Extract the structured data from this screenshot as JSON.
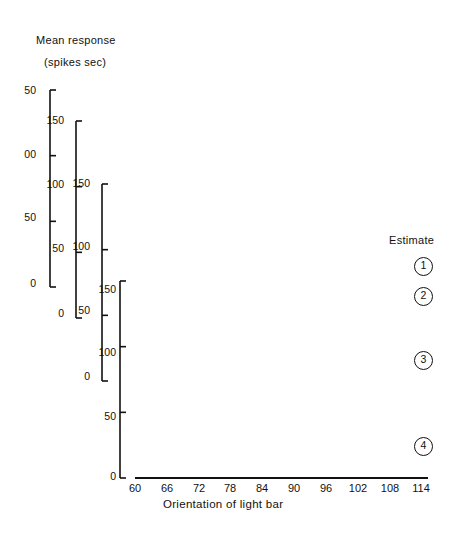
{
  "figure": {
    "y_axis_title_line1": "Mean response",
    "y_axis_title_line2": "(spikes sec)",
    "x_axis_title": "Orientation of light bar",
    "estimate_label": "Estimate",
    "background_color": "#ffffff",
    "ink_color": "#111111"
  },
  "axes": {
    "y_tick_labels": [
      "150",
      "100",
      "50",
      "0"
    ],
    "y_tick_values": [
      150,
      100,
      50,
      0
    ],
    "y_units": "spikes/sec",
    "axis1_top_label_clipped": "50",
    "axis1_mid_label_clipped": "00",
    "x_tick_labels": [
      "60",
      "66",
      "72",
      "78",
      "84",
      "90",
      "96",
      "102",
      "108",
      "114"
    ],
    "x_tick_values": [
      60,
      66,
      72,
      78,
      84,
      90,
      96,
      102,
      108,
      114
    ],
    "x_units": "degrees",
    "x_degree_marks": "°"
  },
  "annotations": {
    "peak_line_orientation": 84,
    "peak_line_style": "dashed",
    "peak_arrow_direction": "up",
    "arrow_count": 4
  },
  "curves": [
    {
      "id": 1,
      "label": "1",
      "marker": "open-circle"
    },
    {
      "id": 2,
      "label": "2",
      "marker": "filled-circle"
    },
    {
      "id": 3,
      "label": "3",
      "marker": "open-circle"
    },
    {
      "id": 4,
      "label": "4",
      "marker": "filled-circle"
    }
  ],
  "chart_data": {
    "type": "line",
    "xlabel": "Orientation of light bar",
    "ylabel": "Mean response (spikes sec)",
    "xlim": [
      60,
      114
    ],
    "ylim": [
      0,
      150
    ],
    "grid": false,
    "legend": "Estimate 1-4, right side, circled numbers",
    "x": [
      60,
      63,
      66,
      69,
      72,
      75,
      78,
      81,
      84,
      87,
      90,
      93,
      96,
      99,
      102,
      105,
      108,
      111,
      114
    ],
    "series": [
      {
        "name": "Estimate 1",
        "marker": "open-circle",
        "values": [
          41,
          37,
          46,
          62,
          82,
          103,
          124,
          139,
          147,
          149,
          141,
          126,
          110,
          96,
          83,
          72,
          62,
          55,
          50
        ]
      },
      {
        "name": "Estimate 2",
        "marker": "filled-circle",
        "values": [
          30,
          27,
          36,
          54,
          76,
          100,
          122,
          137,
          145,
          143,
          132,
          118,
          101,
          85,
          71,
          60,
          52,
          45,
          40
        ]
      },
      {
        "name": "Estimate 3",
        "marker": "open-circle",
        "values": [
          18,
          15,
          24,
          42,
          66,
          94,
          119,
          138,
          146,
          142,
          128,
          109,
          89,
          71,
          57,
          47,
          40,
          36,
          33
        ]
      },
      {
        "name": "Estimate 4",
        "marker": "filled-circle",
        "values": [
          6,
          9,
          19,
          37,
          62,
          90,
          116,
          136,
          144,
          140,
          124,
          103,
          82,
          64,
          50,
          41,
          34,
          29,
          25
        ]
      }
    ]
  }
}
